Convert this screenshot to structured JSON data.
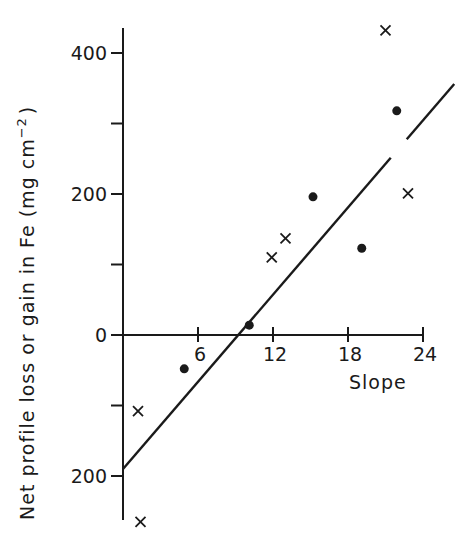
{
  "chart_data": {
    "type": "scatter",
    "title": "",
    "xlabel": "Slope",
    "ylabel": "Net profile loss or gain in Fe (mg cm",
    "ylabel_superscript": "-2",
    "ylabel_close": ")",
    "xlim": [
      0,
      26.5
    ],
    "ylim": [
      -280,
      440
    ],
    "x_ticks": [
      6,
      12,
      18,
      24
    ],
    "x_tick_labels": [
      "6",
      "12",
      "18",
      "24"
    ],
    "y_ticks": [
      -200,
      -100,
      0,
      100,
      200,
      300,
      400
    ],
    "y_tick_labels": {
      "-200": "200",
      "0": "0",
      "200": "200",
      "400": "400"
    },
    "grid": false,
    "legend": null,
    "series": [
      {
        "name": "dots",
        "marker": "filled-circle",
        "points": [
          {
            "x": 4.9,
            "y": -48
          },
          {
            "x": 10.1,
            "y": 14
          },
          {
            "x": 15.2,
            "y": 196
          },
          {
            "x": 19.1,
            "y": 123
          },
          {
            "x": 21.9,
            "y": 318
          }
        ]
      },
      {
        "name": "crosses",
        "marker": "x",
        "points": [
          {
            "x": 1.2,
            "y": -108
          },
          {
            "x": 1.4,
            "y": -265
          },
          {
            "x": 11.9,
            "y": 110
          },
          {
            "x": 13.0,
            "y": 137
          },
          {
            "x": 21.0,
            "y": 432
          },
          {
            "x": 22.8,
            "y": 201
          }
        ]
      }
    ],
    "regression_line": {
      "x_start": 0,
      "y_start": -190,
      "x_end": 26.5,
      "y_end": 356,
      "gap_near": {
        "x": 21.9,
        "y": 318
      }
    }
  },
  "labels": {
    "x_axis_title": "Slope",
    "y_axis_title": "Net profile loss or gain in Fe (mg cm",
    "y_axis_superscript": "−2",
    "y_axis_close": ")"
  },
  "colors": {
    "ink": "#1a1a1a",
    "background": "#ffffff"
  }
}
